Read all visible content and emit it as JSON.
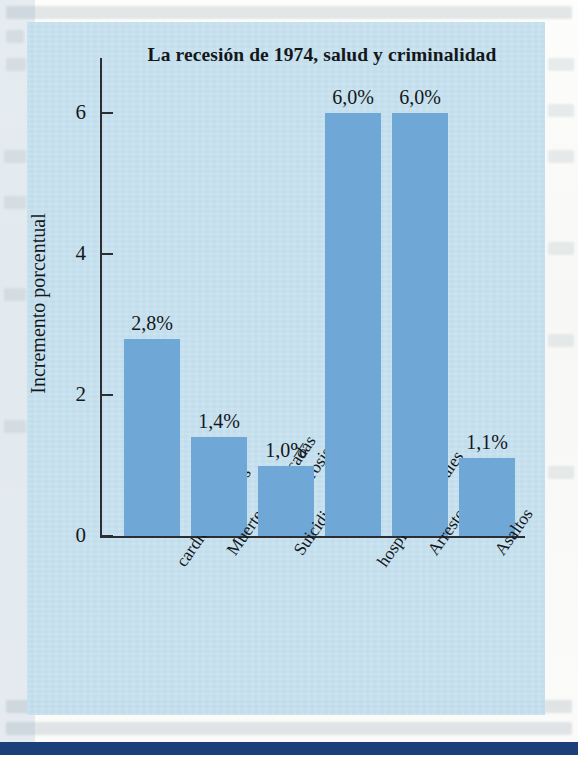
{
  "chart_data": {
    "type": "bar",
    "title": "La recesión de 1974, salud y criminalidad",
    "xlabel": "",
    "ylabel": "Incremento porcentual",
    "ylim": [
      0,
      6.8
    ],
    "yticks": [
      "0",
      "2",
      "4",
      "6"
    ],
    "ytick_values": [
      0,
      2,
      4,
      6
    ],
    "grid": false,
    "legend": "none",
    "categories": [
      "Muertes\ncardiovasculares",
      "Muertes provocadas\npor cirrosis",
      "Suicidios",
      "Ingreso en\nhospitales mentales",
      "Arrestos",
      "Asaltos"
    ],
    "values": [
      2.8,
      1.4,
      1.0,
      6.0,
      6.0,
      1.1
    ],
    "value_labels": [
      "2,8%",
      "1,4%",
      "1,0%",
      "6,0%",
      "6,0%",
      "1,1%"
    ],
    "bar_color": "#6fa8d6",
    "panel_color": "#bddcec",
    "axis_color": "#2b2f33",
    "text_color": "#14171a"
  }
}
